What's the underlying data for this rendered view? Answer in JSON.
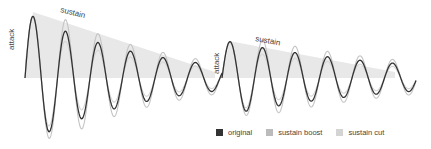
{
  "diagram": {
    "labels": {
      "attack_1": "attack",
      "sustain_1": "sustain",
      "attack_2": "attack",
      "sustain_2": "sustain"
    },
    "colors": {
      "original": "#333333",
      "sustain_boost": "#bbbbbb",
      "sustain_cut": "#d4d4d4",
      "envelope_fill": "#e6e6e6"
    }
  },
  "legend": {
    "items": [
      {
        "label": "original",
        "color": "#333333"
      },
      {
        "label": "sustain boost",
        "color": "#bbbbbb"
      },
      {
        "label": "sustain cut",
        "color": "#d4d4d4"
      }
    ]
  }
}
